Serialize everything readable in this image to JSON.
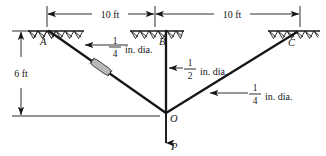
{
  "figure": {
    "background_color": "#ffffff",
    "line_color": "#161616",
    "turnbuckle_color": "#b9b9b9"
  },
  "dimensions": {
    "span_left": {
      "label": "10 ft",
      "value": 10,
      "unit": "ft"
    },
    "span_right": {
      "label": "10 ft",
      "value": 10,
      "unit": "ft"
    },
    "height": {
      "label": "6 ft",
      "value": 6,
      "unit": "ft"
    }
  },
  "nodes": {
    "a": {
      "label": "A"
    },
    "b": {
      "label": "B"
    },
    "c": {
      "label": "C"
    },
    "o": {
      "label": "O"
    }
  },
  "load": {
    "label": "P",
    "direction": "down"
  },
  "members": [
    {
      "id": "ao",
      "from": "A",
      "to": "O",
      "numerator": "1",
      "denominator": "4",
      "unit_text": "in. dia.",
      "has_turnbuckle": true
    },
    {
      "id": "bo",
      "from": "B",
      "to": "O",
      "numerator": "1",
      "denominator": "2",
      "unit_text": "in. dia.",
      "has_turnbuckle": false
    },
    {
      "id": "co",
      "from": "C",
      "to": "O",
      "numerator": "1",
      "denominator": "4",
      "unit_text": "in. dia.",
      "has_turnbuckle": false
    }
  ]
}
